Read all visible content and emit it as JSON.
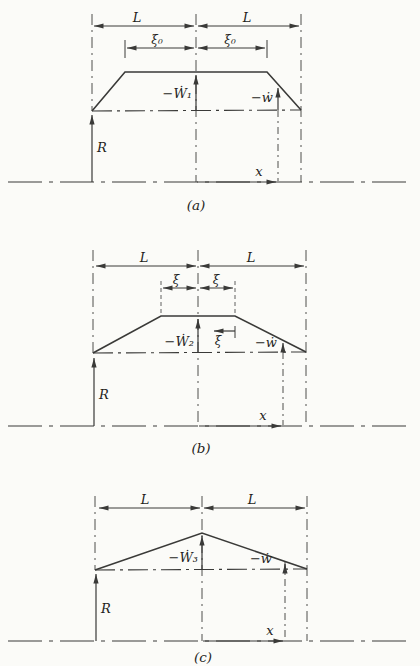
{
  "figure": {
    "background_color": "#fbfbf8",
    "line_color": "#3a3a38",
    "text_color": "#1f1f1d"
  },
  "diagrams": [
    {
      "caption": "(a)",
      "span_label_left": "L",
      "span_label_right": "L",
      "hinge_label_left": "ξ₀",
      "hinge_label_right": "ξ₀",
      "center_velocity_label": "−Ẇ₁",
      "local_velocity_label": "−ẇ",
      "reaction_label": "R",
      "coordinate_label": "x"
    },
    {
      "caption": "(b)",
      "span_label_left": "L",
      "span_label_right": "L",
      "hinge_label_left": "ξ",
      "hinge_label_right": "ξ",
      "hinge_coordinate_label": "ξ",
      "center_velocity_label": "−Ẇ₂",
      "local_velocity_label": "−ẇ",
      "reaction_label": "R",
      "coordinate_label": "x"
    },
    {
      "caption": "(c)",
      "span_label_left": "L",
      "span_label_right": "L",
      "center_velocity_label": "−Ẇ₃",
      "local_velocity_label": "−ẇ",
      "reaction_label": "R",
      "coordinate_label": "x"
    }
  ]
}
